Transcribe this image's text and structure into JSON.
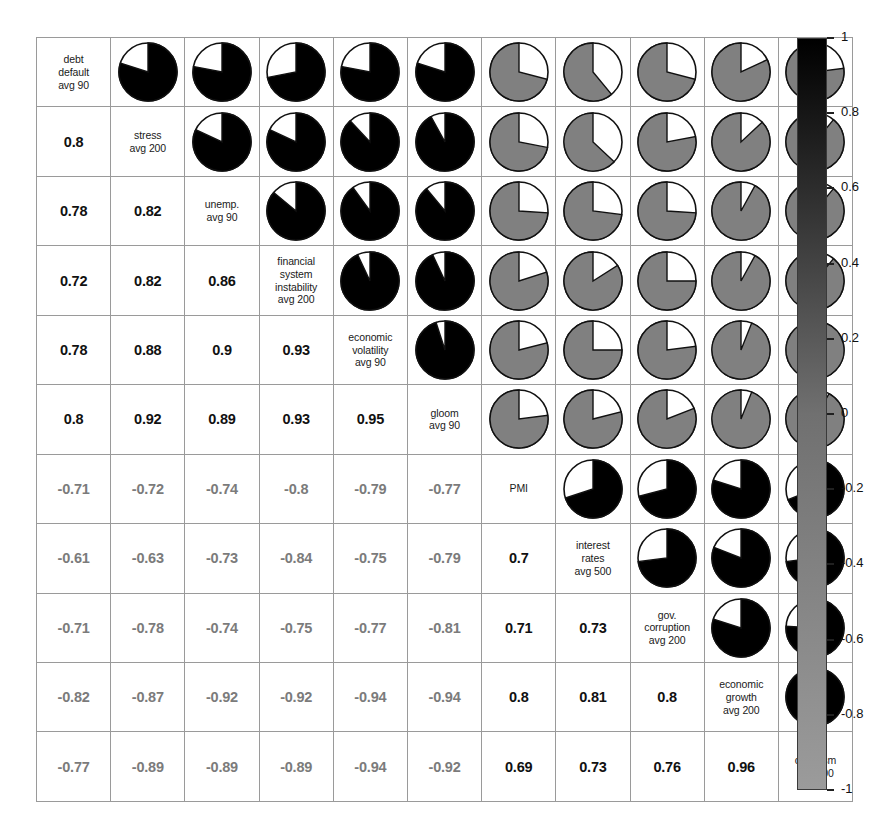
{
  "chart_data": {
    "type": "heatmap",
    "title": "",
    "subtitle": "",
    "xlabel": "",
    "ylabel": "",
    "grid": true,
    "legend_position": "right",
    "colorbar": {
      "min": -1,
      "max": 1,
      "ticks": [
        1,
        0.8,
        0.6,
        0.4,
        0.2,
        0,
        -0.2,
        -0.4,
        -0.6,
        -0.8,
        -1
      ],
      "tick_labels": [
        "1",
        "0.8",
        "0.6",
        "0.4",
        "0.2",
        "0",
        "-0.2",
        "-0.4",
        "-0.6",
        "-0.8",
        "-1"
      ],
      "color_high": "#000000",
      "color_mid": "#707070",
      "color_low": "#9b9b9b"
    },
    "variables": [
      "debt default avg 90",
      "stress avg 200",
      "unemp. avg 90",
      "financial system instability avg 200",
      "economic volatility avg 90",
      "gloom avg 90",
      "PMI",
      "interest rates avg 500",
      "gov. corruption avg 200",
      "economic growth avg 200",
      "optimism avg 200"
    ],
    "variable_labels": [
      [
        "debt",
        "default",
        "avg 90"
      ],
      [
        "stress",
        "avg 200"
      ],
      [
        "unemp.",
        "avg 90"
      ],
      [
        "financial",
        "system",
        "instability",
        "avg 200"
      ],
      [
        "economic",
        "volatility",
        "avg 90"
      ],
      [
        "gloom",
        "avg 90"
      ],
      [
        "PMI"
      ],
      [
        "interest",
        "rates",
        "avg 500"
      ],
      [
        "gov.",
        "corruption",
        "avg 200"
      ],
      [
        "economic",
        "growth",
        "avg 200"
      ],
      [
        "optimism",
        "avg 200"
      ]
    ],
    "matrix": [
      [
        null,
        0.8,
        0.78,
        0.72,
        0.78,
        0.8,
        -0.71,
        -0.61,
        -0.71,
        -0.82,
        -0.77
      ],
      [
        0.8,
        null,
        0.82,
        0.82,
        0.88,
        0.92,
        -0.72,
        -0.63,
        -0.78,
        -0.87,
        -0.89
      ],
      [
        0.78,
        0.82,
        null,
        0.86,
        0.9,
        0.89,
        -0.74,
        -0.73,
        -0.74,
        -0.92,
        -0.89
      ],
      [
        0.72,
        0.82,
        0.86,
        null,
        0.93,
        0.93,
        -0.8,
        -0.84,
        -0.75,
        -0.92,
        -0.89
      ],
      [
        0.78,
        0.88,
        0.9,
        0.93,
        null,
        0.95,
        -0.79,
        -0.75,
        -0.77,
        -0.94,
        -0.94
      ],
      [
        0.8,
        0.92,
        0.89,
        0.93,
        0.95,
        null,
        -0.77,
        -0.79,
        -0.81,
        -0.94,
        -0.92
      ],
      [
        -0.71,
        -0.72,
        -0.74,
        -0.8,
        -0.79,
        -0.77,
        null,
        0.7,
        0.71,
        0.8,
        0.69
      ],
      [
        -0.61,
        -0.63,
        -0.73,
        -0.84,
        -0.75,
        -0.79,
        0.7,
        null,
        0.73,
        0.81,
        0.73
      ],
      [
        -0.71,
        -0.78,
        -0.74,
        -0.75,
        -0.77,
        -0.81,
        0.71,
        0.73,
        null,
        0.8,
        0.76
      ],
      [
        -0.82,
        -0.87,
        -0.92,
        -0.92,
        -0.94,
        -0.94,
        0.8,
        0.81,
        0.8,
        null,
        0.96
      ],
      [
        -0.77,
        -0.89,
        -0.89,
        -0.89,
        -0.94,
        -0.92,
        0.69,
        0.73,
        0.76,
        0.96,
        null
      ]
    ],
    "lower_triangle": "numeric labels",
    "upper_triangle": "pie glyphs",
    "pie_fill_positive": "#000000",
    "pie_fill_negative": "#808080",
    "pie_background": "#ffffff",
    "cell_values_text": {
      "row2": [
        "0.8"
      ],
      "row3": [
        "0.78",
        "0.82"
      ],
      "row4": [
        "0.72",
        "0.82",
        "0.86"
      ],
      "row5": [
        "0.78",
        "0.88",
        "0.9",
        "0.93"
      ],
      "row6": [
        "0.8",
        "0.92",
        "0.89",
        "0.93",
        "0.95"
      ],
      "row7": [
        "-0.71",
        "-0.72",
        "-0.74",
        "-0.8",
        "-0.79",
        "-0.77"
      ],
      "row8": [
        "-0.61",
        "-0.63",
        "-0.73",
        "-0.84",
        "-0.75",
        "-0.79",
        "0.7"
      ],
      "row9": [
        "-0.71",
        "-0.78",
        "-0.74",
        "-0.75",
        "-0.77",
        "-0.81",
        "0.71",
        "0.73"
      ],
      "row10": [
        "-0.82",
        "-0.87",
        "-0.92",
        "-0.92",
        "-0.94",
        "-0.94",
        "0.8",
        "0.81",
        "0.8"
      ],
      "row11": [
        "-0.77",
        "-0.89",
        "-0.89",
        "-0.89",
        "-0.94",
        "-0.92",
        "0.69",
        "0.73",
        "0.76",
        "0.96"
      ]
    }
  }
}
